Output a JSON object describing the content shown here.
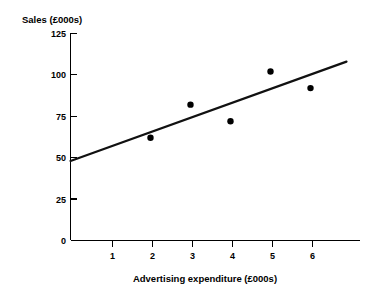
{
  "chart_data": {
    "type": "scatter",
    "title": "",
    "xlabel": "Advertising expenditure (£000s)",
    "ylabel": "Sales (£000s)",
    "xlim": [
      0,
      6.9
    ],
    "ylim": [
      0,
      125
    ],
    "xticks": [
      "1",
      "2",
      "3",
      "4",
      "5",
      "6"
    ],
    "xtick_values": [
      1,
      2,
      3,
      4,
      5,
      6
    ],
    "yticks": [
      "0",
      "25",
      "50",
      "75",
      "100",
      "125"
    ],
    "ytick_values": [
      0,
      25,
      50,
      75,
      100,
      125
    ],
    "grid": false,
    "legend": false,
    "series": [
      {
        "name": "Observations",
        "type": "scatter",
        "marker": "filled-circle",
        "color": "#000000",
        "points": [
          {
            "x": 2,
            "y": 62
          },
          {
            "x": 3,
            "y": 82
          },
          {
            "x": 4,
            "y": 72
          },
          {
            "x": 5,
            "y": 102
          },
          {
            "x": 6,
            "y": 92
          }
        ]
      },
      {
        "name": "Line of best fit",
        "type": "line",
        "color": "#111111",
        "points": [
          {
            "x": 0,
            "y": 48
          },
          {
            "x": 6.9,
            "y": 108
          }
        ]
      }
    ]
  },
  "axes": {
    "y_axis_title": "Sales (£000s)",
    "x_axis_title": "Advertising expenditure (£000s)"
  }
}
